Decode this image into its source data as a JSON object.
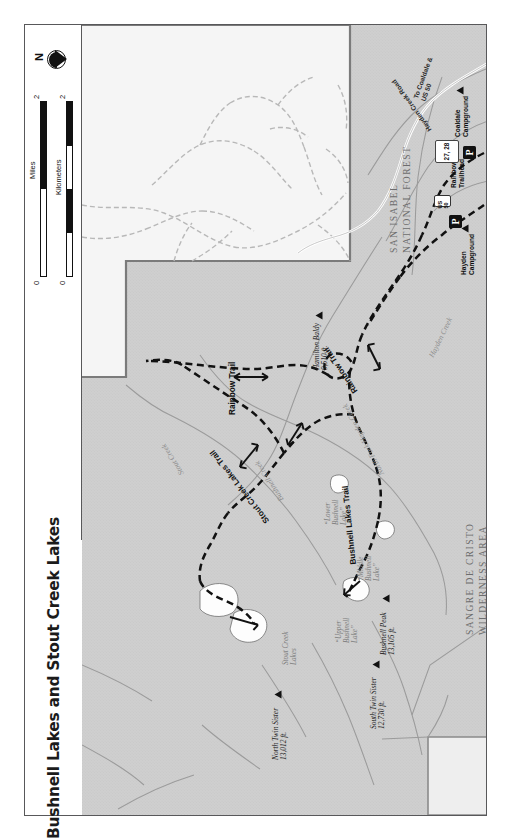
{
  "title": "Bushnell Lakes and Stout Creek Lakes",
  "compass": {
    "north_label": "N",
    "icon": "compass-rose-icon"
  },
  "scale": {
    "kilometers": {
      "unit_label": "Kilometers",
      "min": "0",
      "max": "2"
    },
    "miles": {
      "unit_label": "Miles",
      "min": "0",
      "max": "2"
    }
  },
  "area_labels": [
    {
      "name": "san-isabel-national-forest",
      "line1": "SAN ISABEL",
      "line2": "NATIONAL FOREST"
    },
    {
      "name": "sangre-de-cristo-wilderness",
      "line1": "SANGRE DE CRISTO",
      "line2": "WILDERNESS AREA"
    }
  ],
  "peaks": [
    {
      "name": "north-twin-sister",
      "label": "North Twin Sister",
      "elevation": "13,012 ft."
    },
    {
      "name": "south-twin-sister",
      "label": "South Twin Sister",
      "elevation": "12,730 ft."
    },
    {
      "name": "bushnell-peak",
      "label": "Bushnell Peak",
      "elevation": "13,105 ft."
    },
    {
      "name": "hamilton-baldy",
      "label": "Hamilton Baldy",
      "elevation": "9,510 ft."
    }
  ],
  "lakes": [
    {
      "name": "stout-creek-lakes",
      "line1": "Stout Creek",
      "line2": "Lakes"
    },
    {
      "name": "lower-bushnell-lake",
      "line1": "“Lower",
      "line2": "Bushnell",
      "line3": "Lake”"
    },
    {
      "name": "middle-bushnell-lake",
      "line1": "“Middle",
      "line2": "Bushnell",
      "line3": "Lake”"
    },
    {
      "name": "upper-bushnell-lake",
      "line1": "“Upper",
      "line2": "Bushnell",
      "line3": "Lake”"
    }
  ],
  "streams": [
    {
      "name": "stout-creek",
      "label": "Stout Creek"
    },
    {
      "name": "bushnell-creek",
      "label": "Bushnell Creek"
    },
    {
      "name": "north-fork-hayden-creek",
      "label": "North Fork Hayden Creek"
    },
    {
      "name": "hayden-creek",
      "label": "Hayden Creek"
    }
  ],
  "trails": [
    {
      "name": "rainbow-trail-west",
      "label": "Rainbow Trail"
    },
    {
      "name": "rainbow-trail-east",
      "label": "Rainbow Trail"
    },
    {
      "name": "bushnell-lakes-trail",
      "label": "Bushnell Lakes Trail"
    },
    {
      "name": "stout-creek-lakes-trail",
      "label": "Stout Creek Lakes Trail"
    }
  ],
  "poi": [
    {
      "name": "coaldale-campground",
      "line1": "Coaldale",
      "line2": "Campground",
      "marker": "campground-triangle-icon"
    },
    {
      "name": "rainbow-trailhead",
      "line1": "Rainbow",
      "line2": "Trailhead",
      "marker": "parking-icon"
    },
    {
      "name": "hayden-campground",
      "line1": "Hayden",
      "line2": "Campground",
      "marker": "campground-triangle-icon"
    }
  ],
  "roads": [
    {
      "name": "hayden-creek-road",
      "label": "Hayden Creek Road"
    },
    {
      "name": "to-coaldale-us50",
      "line1": "To Coaldale &",
      "line2": "US 50"
    }
  ],
  "shields": [
    {
      "name": "route-shield-us50",
      "label": "US 50"
    }
  ],
  "mile_markers": [
    {
      "name": "mile-marker-27-28",
      "label": "27, 28"
    }
  ],
  "colors": {
    "forest_fill": "#cfcfcf",
    "private_fill": "#f4f4f4",
    "trail_line": "#111111",
    "water_line": "#9a9a9a",
    "road_line": "#ffffff",
    "frame": "#58585a",
    "title_text": "#1b1b1b"
  }
}
